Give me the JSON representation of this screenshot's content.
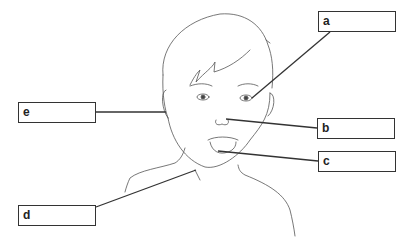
{
  "diagram": {
    "labels": [
      {
        "id": "a",
        "letter": "a",
        "box": [
          318,
          11
        ],
        "pointer_to": [
          252,
          98
        ]
      },
      {
        "id": "b",
        "letter": "b",
        "box": [
          317,
          118
        ],
        "pointer_to": [
          226,
          119
        ]
      },
      {
        "id": "c",
        "letter": "c",
        "box": [
          318,
          151
        ],
        "pointer_to": [
          218,
          151
        ]
      },
      {
        "id": "d",
        "letter": "d",
        "box": [
          18,
          205
        ],
        "pointer_to": [
          196,
          170
        ]
      },
      {
        "id": "e",
        "letter": "e",
        "box": [
          18,
          102
        ],
        "pointer_to": [
          166,
          112
        ]
      }
    ],
    "colors": {
      "line": "#333333",
      "sketch": "#555555",
      "background": "#ffffff"
    }
  }
}
